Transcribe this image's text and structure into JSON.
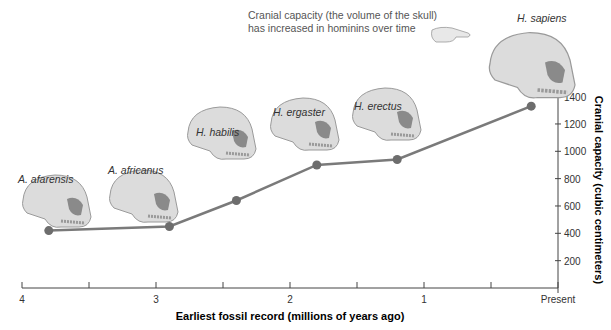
{
  "annotation": {
    "line1": "Cranial capacity (the volume of the skull)",
    "line2": "has increased in hominins over time"
  },
  "chart_data": {
    "type": "line",
    "title": "",
    "xlabel": "Earliest fossil record (millions of years ago)",
    "ylabel": "Cranial capacity (cubic centimeters)",
    "x_ticks": [
      "4",
      "3",
      "2",
      "1",
      "Present"
    ],
    "y_ticks": [
      "200",
      "400",
      "600",
      "800",
      "1000",
      "1200",
      "1400"
    ],
    "xlim": [
      4,
      0
    ],
    "ylim": [
      0,
      1400
    ],
    "grid": false,
    "series": [
      {
        "name": "Cranial capacity",
        "color": "#7a7a7a",
        "points": [
          {
            "species": "A. afarensis",
            "x": 3.8,
            "y": 420
          },
          {
            "species": "A. africanus",
            "x": 2.9,
            "y": 450
          },
          {
            "species": "H. habilis",
            "x": 2.4,
            "y": 640
          },
          {
            "species": "H. ergaster",
            "x": 1.8,
            "y": 900
          },
          {
            "species": "H. erectus",
            "x": 1.2,
            "y": 940
          },
          {
            "species": "H. sapiens",
            "x": 0.2,
            "y": 1330
          }
        ]
      }
    ]
  },
  "species_labels": [
    "A. afarensis",
    "A. africanus",
    "H. habilis",
    "H. ergaster",
    "H. erectus",
    "H. sapiens"
  ]
}
